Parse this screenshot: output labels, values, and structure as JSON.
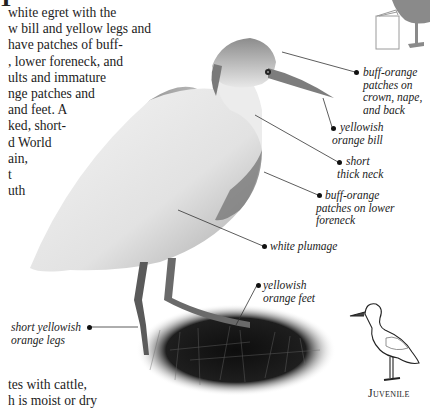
{
  "page": {
    "title_fragment": "T",
    "body_lines": [
      "white egret with the",
      "w bill and yellow legs and",
      "have patches of buff-",
      ", lower foreneck, and",
      "ults and immature",
      "nge patches and",
      "and feet. A",
      "ked, short-",
      "d World",
      "ain,",
      "t",
      "uth"
    ],
    "bottom_lines": [
      "tes with cattle,",
      "h is moist or dry"
    ]
  },
  "annotations": [
    {
      "id": "crown",
      "lines": [
        "buff-orange",
        "patches on",
        "crown, nape,",
        "and back"
      ]
    },
    {
      "id": "bill",
      "lines": [
        "yellowish",
        "orange bill"
      ]
    },
    {
      "id": "neck",
      "lines": [
        "short",
        "thick neck"
      ]
    },
    {
      "id": "foreneck",
      "lines": [
        "buff-orange",
        "patches on lower",
        "foreneck"
      ]
    },
    {
      "id": "plumage",
      "lines": [
        "white plumage"
      ]
    },
    {
      "id": "feet",
      "lines": [
        "yellowish",
        "orange feet"
      ]
    },
    {
      "id": "legs",
      "lines": [
        "short yellowish",
        "orange legs"
      ]
    }
  ],
  "icons": {
    "book": "book-icon",
    "silhouette": "bird-silhouette-icon",
    "juvenile": "juvenile-bird-outline"
  },
  "juvenile_label": "Juvenile",
  "colors": {
    "text": "#1c1c1c",
    "silhouette": "#8a8a8a",
    "leader": "#333333"
  }
}
